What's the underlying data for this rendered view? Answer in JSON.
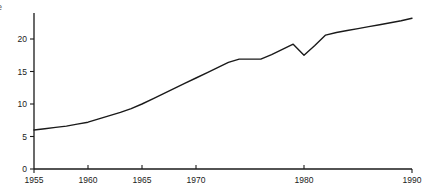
{
  "chart_data": {
    "type": "line",
    "title": "",
    "subtitle": "",
    "xlabel": "",
    "ylabel": "",
    "partial_corner_text": "e",
    "xlim": [
      1955,
      1990
    ],
    "ylim": [
      0,
      24
    ],
    "grid": false,
    "legend": null,
    "x_ticks": [
      1955,
      1960,
      1965,
      1970,
      1980,
      1990
    ],
    "x_tick_labels": [
      "1955",
      "1960",
      "1965",
      "1970",
      "1980",
      "1990"
    ],
    "y_ticks": [
      0,
      5,
      10,
      15,
      20
    ],
    "y_tick_labels": [
      "0",
      "5",
      "10",
      "15",
      "20"
    ],
    "line_color": "#1a1a1a",
    "axis_color": "#1a1a1a",
    "background_color": "#ffffff",
    "x": [
      1955,
      1956,
      1957,
      1958,
      1959,
      1960,
      1961,
      1962,
      1963,
      1964,
      1965,
      1966,
      1967,
      1968,
      1969,
      1970,
      1971,
      1972,
      1973,
      1974,
      1975,
      1976,
      1977,
      1978,
      1979,
      1980,
      1981,
      1982,
      1983,
      1984,
      1985,
      1986,
      1987,
      1988,
      1989,
      1990
    ],
    "values": [
      6.0,
      6.2,
      6.4,
      6.6,
      6.9,
      7.2,
      7.7,
      8.2,
      8.7,
      9.3,
      10.0,
      10.8,
      11.6,
      12.4,
      13.2,
      14.0,
      14.8,
      15.6,
      16.4,
      16.9,
      16.9,
      16.9,
      17.6,
      18.4,
      19.2,
      17.5,
      19.0,
      20.6,
      21.0,
      21.3,
      21.6,
      21.9,
      22.2,
      22.5,
      22.8,
      23.2
    ],
    "series": [
      {
        "name": "series-1",
        "values": [
          6.0,
          6.2,
          6.4,
          6.6,
          6.9,
          7.2,
          7.7,
          8.2,
          8.7,
          9.3,
          10.0,
          10.8,
          11.6,
          12.4,
          13.2,
          14.0,
          14.8,
          15.6,
          16.4,
          16.9,
          16.9,
          16.9,
          17.6,
          18.4,
          19.2,
          17.5,
          19.0,
          20.6,
          21.0,
          21.3,
          21.6,
          21.9,
          22.2,
          22.5,
          22.8,
          23.2
        ]
      }
    ],
    "annotations": []
  }
}
